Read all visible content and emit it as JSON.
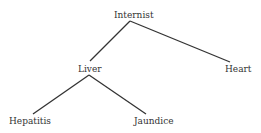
{
  "diagram": {
    "type": "tree",
    "nodes": {
      "internist": "Internist",
      "liver": "Liver",
      "heart": "Heart",
      "hepatitis": "Hepatitis",
      "jaundice": "Jaundice"
    },
    "edges": [
      [
        "Internist",
        "Liver"
      ],
      [
        "Internist",
        "Heart"
      ],
      [
        "Liver",
        "Hepatitis"
      ],
      [
        "Liver",
        "Jaundice"
      ]
    ],
    "line_color": "#333333"
  }
}
